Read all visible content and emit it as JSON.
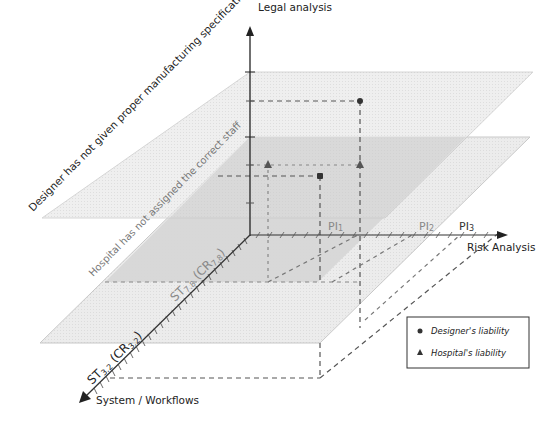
{
  "diagram": {
    "axes": {
      "vertical": {
        "label": "Legal analysis"
      },
      "horizontal": {
        "label": "Risk Analysis",
        "ticks": [
          "PI1",
          "PI2",
          "PI3"
        ]
      },
      "depth": {
        "label": "System / Workflows",
        "ticks": [
          "ST3.2 (CR3.2)",
          "ST7.8 (CR7.8)"
        ]
      }
    },
    "planes": [
      {
        "label": "Designer has not given proper manufacturing specifications",
        "fill": "#e6e6e6"
      },
      {
        "label": "Hospital has not assigned the correct staff",
        "fill": "#d2d2d2"
      }
    ],
    "tick_labels": {
      "pi1": "PI",
      "pi1_sub": "1",
      "pi2": "PI",
      "pi2_sub": "2",
      "pi3": "PI",
      "pi3_sub": "3",
      "st32_main": "ST",
      "st32_sub": "3.2",
      "st32_paren": " (CR",
      "st32_paren_sub": "3.2",
      "st32_close": ")",
      "st78_main": "ST",
      "st78_sub": "7.8",
      "st78_paren": " (CR",
      "st78_paren_sub": "7.8",
      "st78_close": ")"
    },
    "legend": {
      "items": [
        {
          "marker": "circle",
          "label": "Designer's liability"
        },
        {
          "marker": "triangle",
          "label": "Hospital's liability"
        }
      ]
    },
    "colors": {
      "axis": "#222222",
      "dashed": "#555555",
      "plane_upper": "#e8e8e8",
      "plane_lower": "#d4d4d4",
      "tick_text": "#8a8a8a"
    }
  }
}
